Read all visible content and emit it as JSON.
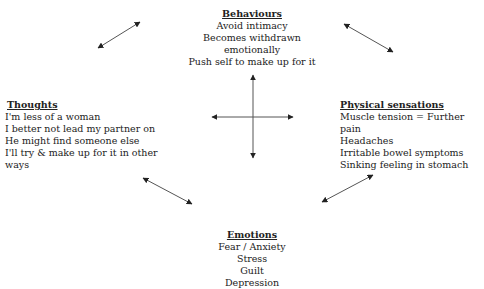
{
  "diagram": {
    "behaviours": {
      "title": "Behaviours",
      "items": [
        "Avoid intimacy",
        "Becomes withdrawn emotionally",
        "Push self to make up for it"
      ]
    },
    "thoughts": {
      "title": "Thoughts",
      "items": [
        "I'm less of a woman",
        "I better not lead my partner on",
        "He might find someone else",
        "I'll try & make up for it in other ways"
      ]
    },
    "physical_sensations": {
      "title": "Physical sensations",
      "items": [
        "Muscle tension = Further pain",
        "Headaches",
        "Irritable bowel symptoms",
        "Sinking feeling in stomach"
      ]
    },
    "emotions": {
      "title": "Emotions",
      "items": [
        "Fear / Anxiety",
        "Stress",
        "Guilt",
        "Depression"
      ]
    },
    "arrow_color": "#333333"
  }
}
